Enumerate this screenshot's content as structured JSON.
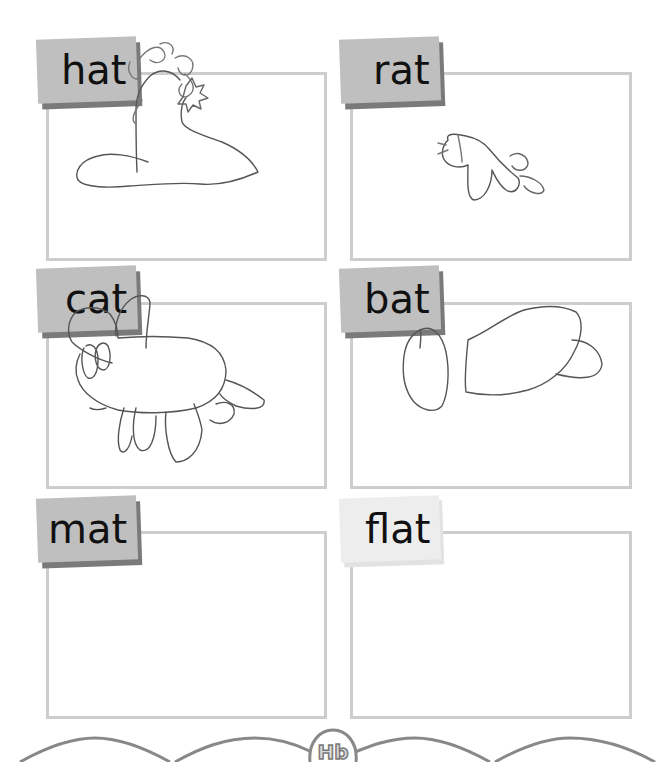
{
  "worksheet": {
    "cells": [
      {
        "word": "hat",
        "drawing": "hat-drawing",
        "tab_style": "dark"
      },
      {
        "word": "rat",
        "drawing": "rat-drawing",
        "tab_style": "dark"
      },
      {
        "word": "cat",
        "drawing": "cat-drawing",
        "tab_style": "dark"
      },
      {
        "word": "bat",
        "drawing": "bat-drawing",
        "tab_style": "dark"
      },
      {
        "word": "mat",
        "drawing": "empty",
        "tab_style": "dark"
      },
      {
        "word": "flat",
        "drawing": "empty",
        "tab_style": "light"
      }
    ]
  },
  "footer": {
    "logo_text": "Hb",
    "decoration": "wavy-border"
  },
  "colors": {
    "box_border": "#cdcdcd",
    "tab_fill": "#bfbfbf",
    "tab_shadow": "#7a7a7a",
    "pencil": "#555555",
    "text": "#111111"
  }
}
